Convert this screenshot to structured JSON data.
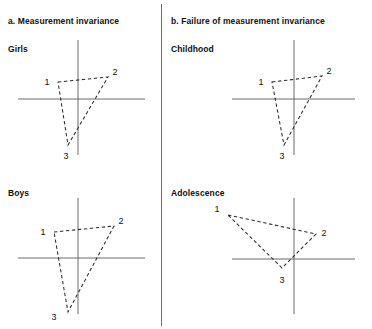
{
  "figure": {
    "background": "#ffffff",
    "divider_color": "#6e6e6e",
    "axis_color": "#6a6a6a",
    "line_color": "#2b2b2b"
  },
  "panels": {
    "a": {
      "title": "a. Measurement invariance"
    },
    "b": {
      "title": "b. Failure of measurement invariance"
    }
  },
  "subpanels": {
    "girls": {
      "title": "Girls"
    },
    "boys": {
      "title": "Boys"
    },
    "childhood": {
      "title": "Childhood"
    },
    "adolescence": {
      "title": "Adolescence"
    }
  },
  "point_labels": {
    "p1": "1",
    "p2": "2",
    "p3": "3"
  },
  "chart_data": {
    "type": "scatter",
    "grid": false,
    "legend": false,
    "xlabel": "",
    "ylabel": "",
    "panels": [
      {
        "panel": "a",
        "panel_title": "a. Measurement invariance",
        "subpanel": "Girls",
        "origin_px": [
          78,
          99
        ],
        "xaxis_px": [
          18,
          145
        ],
        "yaxis_px": [
          40,
          155
        ],
        "points": [
          {
            "label": "1",
            "px": [
              58,
              82
            ],
            "xy": [
              -20,
              17
            ]
          },
          {
            "label": "2",
            "px": [
              108,
              77
            ],
            "xy": [
              30,
              22
            ]
          },
          {
            "label": "3",
            "px": [
              68,
              145
            ],
            "xy": [
              -10,
              -46
            ]
          }
        ],
        "closed": true
      },
      {
        "panel": "a",
        "panel_title": "a. Measurement invariance",
        "subpanel": "Boys",
        "origin_px": [
          78,
          258
        ],
        "xaxis_px": [
          18,
          145
        ],
        "yaxis_px": [
          198,
          314
        ],
        "points": [
          {
            "label": "1",
            "px": [
              54,
              232
            ],
            "xy": [
              -24,
              26
            ]
          },
          {
            "label": "2",
            "px": [
              114,
              226
            ],
            "xy": [
              36,
              32
            ]
          },
          {
            "label": "3",
            "px": [
              68,
              312
            ],
            "xy": [
              -10,
              -54
            ]
          }
        ],
        "closed": true
      },
      {
        "panel": "b",
        "panel_title": "b. Failure of measurement invariance",
        "subpanel": "Childhood",
        "origin_px": [
          294,
          99
        ],
        "xaxis_px": [
          232,
          355
        ],
        "yaxis_px": [
          40,
          155
        ],
        "points": [
          {
            "label": "1",
            "px": [
              272,
              82
            ],
            "xy": [
              -22,
              17
            ]
          },
          {
            "label": "2",
            "px": [
              322,
              76
            ],
            "xy": [
              28,
              23
            ]
          },
          {
            "label": "3",
            "px": [
              284,
              145
            ],
            "xy": [
              -10,
              -46
            ]
          }
        ],
        "closed": true
      },
      {
        "panel": "b",
        "panel_title": "b. Failure of measurement invariance",
        "subpanel": "Adolescence",
        "origin_px": [
          294,
          259
        ],
        "xaxis_px": [
          232,
          355
        ],
        "yaxis_px": [
          198,
          314
        ],
        "points": [
          {
            "label": "1",
            "px": [
              228,
              215
            ],
            "xy": [
              -66,
              44
            ]
          },
          {
            "label": "2",
            "px": [
              316,
              234
            ],
            "xy": [
              22,
              25
            ]
          },
          {
            "label": "3",
            "px": [
              282,
              268
            ],
            "xy": [
              -12,
              -9
            ]
          }
        ],
        "closed": true
      }
    ]
  }
}
